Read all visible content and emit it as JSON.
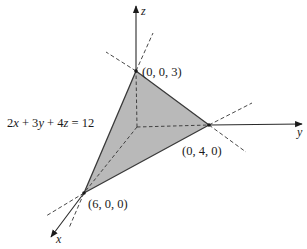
{
  "figure": {
    "type": "3d-plane-intercept-diagram",
    "equation": {
      "parts": [
        "2",
        "x",
        " + 3",
        "y",
        " + 4",
        "z",
        " = 12"
      ],
      "text": "2x + 3y + 4z = 12"
    },
    "axes": {
      "x_label": "x",
      "y_label": "y",
      "z_label": "z"
    },
    "vertices": [
      {
        "name": "z-intercept",
        "label": "(0, 0, 3)",
        "coords": [
          0,
          0,
          3
        ]
      },
      {
        "name": "y-intercept",
        "label": "(0, 4, 0)",
        "coords": [
          0,
          4,
          0
        ]
      },
      {
        "name": "x-intercept",
        "label": "(6, 0, 0)",
        "coords": [
          6,
          0,
          0
        ]
      }
    ],
    "colors": {
      "fill": "#b9b9b9",
      "edge": "#3a3a3a",
      "axis": "#2a2a2a",
      "dash": "#333333",
      "background": "#ffffff"
    }
  }
}
